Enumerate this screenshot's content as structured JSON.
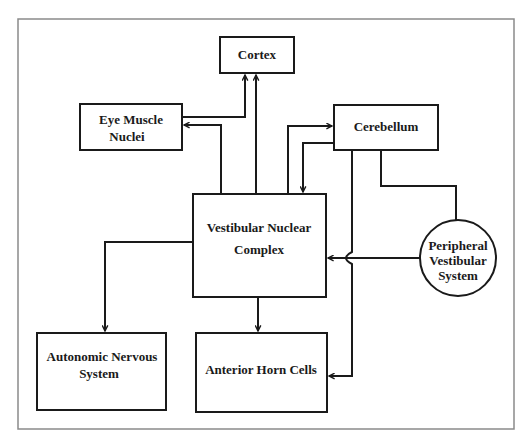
{
  "diagram": {
    "type": "flow-diagram",
    "colors": {
      "line": "#1a1a1a",
      "frame": "#8a8a8a",
      "background": "#ffffff"
    },
    "nodes": {
      "cortex": {
        "label": "Cortex",
        "shape": "rect"
      },
      "eye_muscle_nuclei": {
        "label_line1": "Eye Muscle",
        "label_line2": "Nuclei",
        "shape": "rect"
      },
      "cerebellum": {
        "label": "Cerebellum",
        "shape": "rect"
      },
      "vestibular_nuclear_complex": {
        "label_line1": "Vestibular Nuclear",
        "label_line2": "Complex",
        "shape": "rect"
      },
      "peripheral_vestibular_system": {
        "label_line1": "Peripheral",
        "label_line2": "Vestibular",
        "label_line3": "System",
        "shape": "circle"
      },
      "autonomic_nervous_system": {
        "label_line1": "Autonomic Nervous",
        "label_line2": "System",
        "shape": "rect"
      },
      "anterior_horn_cells": {
        "label": "Anterior Horn Cells",
        "shape": "rect"
      }
    },
    "edges": [
      {
        "from": "Vestibular Nuclear Complex",
        "to": "Eye Muscle Nuclei"
      },
      {
        "from": "Eye Muscle Nuclei",
        "to": "Cortex"
      },
      {
        "from": "Vestibular Nuclear Complex",
        "to": "Cortex"
      },
      {
        "from": "Vestibular Nuclear Complex",
        "to": "Cerebellum"
      },
      {
        "from": "Cerebellum",
        "to": "Vestibular Nuclear Complex"
      },
      {
        "from": "Cerebellum",
        "to": "Anterior Horn Cells"
      },
      {
        "from": "Cerebellum",
        "to": "Peripheral Vestibular System",
        "arrow": false
      },
      {
        "from": "Peripheral Vestibular System",
        "to": "Vestibular Nuclear Complex"
      },
      {
        "from": "Vestibular Nuclear Complex",
        "to": "Autonomic Nervous System"
      },
      {
        "from": "Vestibular Nuclear Complex",
        "to": "Anterior Horn Cells"
      }
    ]
  }
}
